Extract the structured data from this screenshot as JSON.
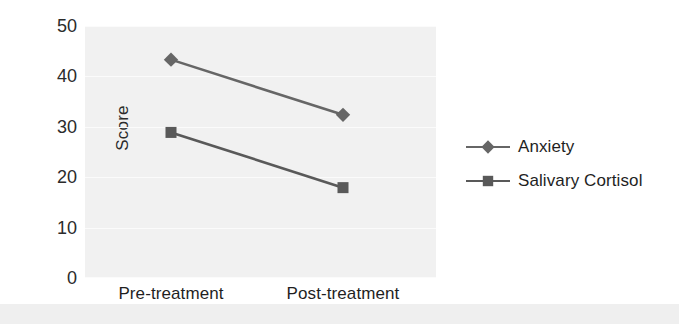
{
  "chart_data": {
    "type": "line",
    "title": "",
    "xlabel": "",
    "ylabel": "Score",
    "categories": [
      "Pre-treatment",
      "Post-treatment"
    ],
    "ylim": [
      0,
      50
    ],
    "yticks": [
      0,
      10,
      20,
      30,
      40,
      50
    ],
    "ytick_labels": [
      "0",
      "10",
      "20",
      "30",
      "40",
      "50"
    ],
    "grid": true,
    "legend_position": "right",
    "series": [
      {
        "name": "Anxiety",
        "marker": "diamond",
        "color": "#666666",
        "values": [
          43.5,
          32.5
        ]
      },
      {
        "name": "Salivary Cortisol",
        "marker": "square",
        "color": "#595959",
        "values": [
          29.0,
          18.0
        ]
      }
    ]
  },
  "colors": {
    "plot_background": "#f1f1f1",
    "gridline": "#fbfbfb",
    "text": "#1f1f1f",
    "series_anxiety": "#666666",
    "series_cortisol": "#595959"
  }
}
